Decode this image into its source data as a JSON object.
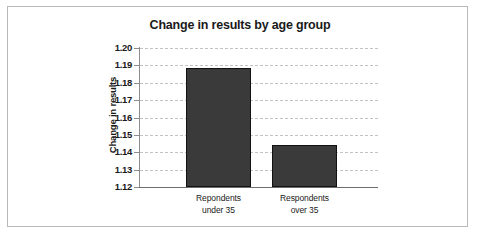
{
  "chart_data": {
    "type": "bar",
    "title": "Change in results by age group",
    "xlabel": "",
    "ylabel": "Change in results",
    "categories": [
      "Repondents under 35",
      "Respondents over 35"
    ],
    "category_lines": [
      [
        "Repondents",
        "under 35"
      ],
      [
        "Respondents",
        "over 35"
      ]
    ],
    "values": [
      1.1885,
      1.1442
    ],
    "ylim": [
      1.12,
      1.2
    ],
    "ytick_step": 0.01,
    "ytick_labels": [
      "1.20",
      "1.19",
      "1.18",
      "1.17",
      "1.16",
      "1.15",
      "1.14",
      "1.13",
      "1.12"
    ],
    "ytick_values": [
      1.2,
      1.19,
      1.18,
      1.17,
      1.16,
      1.15,
      1.14,
      1.13,
      1.12
    ],
    "grid": true,
    "grid_style": "dashed",
    "legend": false,
    "legend_position": "none",
    "colors": {
      "bar_fill": "#3a3a3a",
      "bar_stroke": "#111111",
      "gridline": "#c2c2c2",
      "axis_line": "#8d8d8d",
      "baseline": "#6e6e6e",
      "text": "#1a1a1a",
      "frame": "#b9b9b9",
      "background": "#ffffff"
    }
  }
}
